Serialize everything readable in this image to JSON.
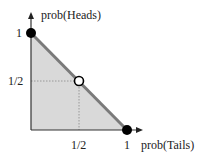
{
  "diagram": {
    "type": "probability-simplex",
    "y_axis_label": "prob(Heads)",
    "x_axis_label": "prob(Tails)",
    "y_ticks": [
      {
        "label": "1",
        "value": 1
      },
      {
        "label": "1/2",
        "value": 0.5
      }
    ],
    "x_ticks": [
      {
        "label": "1/2",
        "value": 0.5
      },
      {
        "label": "1",
        "value": 1
      }
    ],
    "points": [
      {
        "name": "heads-certain",
        "x": 0,
        "y": 1,
        "style": "filled"
      },
      {
        "name": "fair-coin",
        "x": 0.5,
        "y": 0.5,
        "style": "open"
      },
      {
        "name": "tails-certain",
        "x": 1,
        "y": 0,
        "style": "filled"
      }
    ],
    "line": "x + y = 1",
    "shaded_region": "x + y <= 1",
    "colors": {
      "fill": "#d9d9d9",
      "line": "#7a7a7a",
      "axis": "#333333",
      "dot": "#000000"
    }
  }
}
